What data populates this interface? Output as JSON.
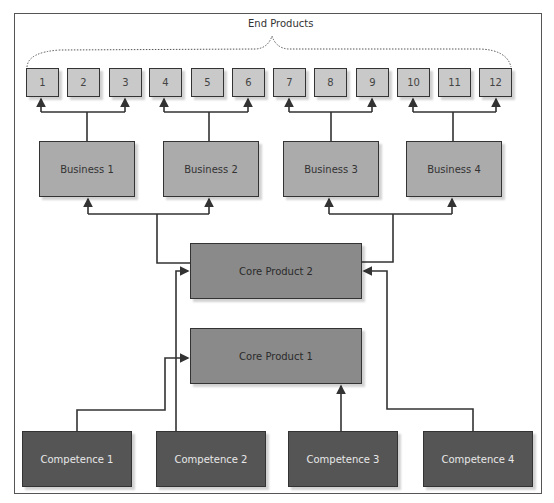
{
  "title": "End Products",
  "end_products": [
    "1",
    "2",
    "3",
    "4",
    "5",
    "6",
    "7",
    "8",
    "9",
    "10",
    "11",
    "12"
  ],
  "businesses": [
    "Business 1",
    "Business 2",
    "Business 3",
    "Business 4"
  ],
  "core_products": {
    "core2": "Core Product 2",
    "core1": "Core Product 1"
  },
  "competences": [
    "Competence 1",
    "Competence 2",
    "Competence 3",
    "Competence 4"
  ],
  "colors": {
    "end_product": "#c9c9c9",
    "business": "#ababab",
    "core_product": "#8a8a8a",
    "competence": "#555555",
    "line": "#333333"
  }
}
